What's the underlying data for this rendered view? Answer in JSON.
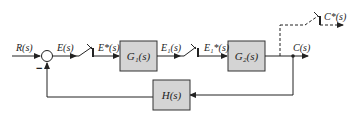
{
  "diagram": {
    "type": "sampled-data feedback control block diagram",
    "colors": {
      "line": "#222222",
      "block_fill": "#d4d4d4",
      "block_border": "#333333",
      "background": "#ffffff"
    },
    "signals": {
      "input": "R(s)",
      "error": "E(s)",
      "sampled_error": "E*(s)",
      "intermediate": "E₁(s)",
      "sampled_intermediate": "E₁*(s)",
      "output": "C(s)",
      "sampled_output": "C*(s)"
    },
    "blocks": {
      "g1": "G₁(s)",
      "g2": "G₂(s)",
      "h": "H(s)"
    },
    "summing_junction": {
      "feedback_sign": "−"
    },
    "samplers": [
      {
        "name": "sampler-1",
        "input": "E(s)",
        "output": "E*(s)"
      },
      {
        "name": "sampler-2",
        "input": "E₁(s)",
        "output": "E₁*(s)"
      },
      {
        "name": "sampler-3",
        "input": "C(s)",
        "output": "C*(s)",
        "style": "dashed"
      }
    ]
  }
}
